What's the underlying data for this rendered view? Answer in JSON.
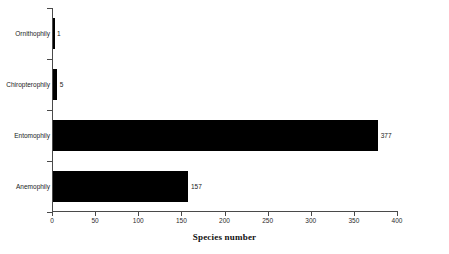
{
  "chart_data": {
    "type": "bar",
    "orientation": "horizontal",
    "title": "",
    "xlabel": "Species number",
    "ylabel": "",
    "xlim": [
      0,
      400
    ],
    "grid": false,
    "legend": null,
    "categories": [
      "Ornithophily",
      "Chiropterophily",
      "Entomophily",
      "Anemophily"
    ],
    "values": [
      1,
      5,
      377,
      157
    ],
    "value_labels": [
      "1",
      "5",
      "377",
      "157"
    ],
    "xticks": [
      0,
      50,
      100,
      150,
      200,
      250,
      300,
      350,
      400
    ],
    "xtick_labels": [
      "0",
      "50",
      "100",
      "150",
      "200",
      "250",
      "300",
      "350",
      "400"
    ],
    "bar_color": "#000000",
    "axis_color": "#4a4a4a"
  }
}
